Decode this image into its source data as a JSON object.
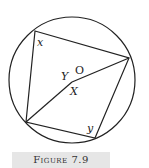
{
  "diagram": {
    "circle": {
      "cx": 72,
      "cy": 80,
      "r": 63
    },
    "points": {
      "A": {
        "x": 35,
        "y": 31
      },
      "B": {
        "x": 129,
        "y": 58
      },
      "C": {
        "x": 26,
        "y": 122
      },
      "D": {
        "x": 95,
        "y": 138
      },
      "O": {
        "x": 72,
        "y": 80
      }
    },
    "labels": {
      "x": "x",
      "y_center": "Y",
      "O": "O",
      "X": "X",
      "y_bottom": "y"
    }
  },
  "caption": "Figure 7.9"
}
